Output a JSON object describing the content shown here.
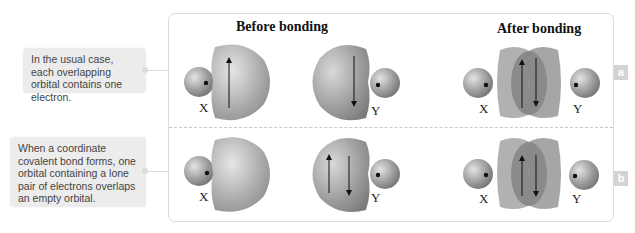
{
  "callouts": [
    {
      "id": "a",
      "text": "In the usual case, each overlapping orbital contains one electron."
    },
    {
      "id": "b",
      "text": "When a coordinate covalent bond forms, one orbital containing a lone pair of electrons overlaps an empty orbital."
    }
  ],
  "headings": {
    "before": "Before bonding",
    "after": "After bonding"
  },
  "rows": [
    {
      "badge": "a",
      "before": {
        "x_label": "X",
        "y_label": "Y",
        "x_orbital_electrons": "up",
        "y_orbital_electrons": "down"
      },
      "after": {
        "x_label": "X",
        "y_label": "Y",
        "shared_electrons": "pair"
      }
    },
    {
      "badge": "b",
      "before": {
        "x_label": "X",
        "y_label": "Y",
        "x_orbital_electrons": "empty",
        "y_orbital_electrons": "lone pair"
      },
      "after": {
        "x_label": "X",
        "y_label": "Y",
        "shared_electrons": "pair"
      }
    }
  ],
  "colors": {
    "orbital": "#a9a9a9",
    "sphere": "#9a9a9a",
    "frame_border": "#dadada",
    "callout_bg": "#ececec",
    "badge_bg": "#d3d3d3"
  }
}
